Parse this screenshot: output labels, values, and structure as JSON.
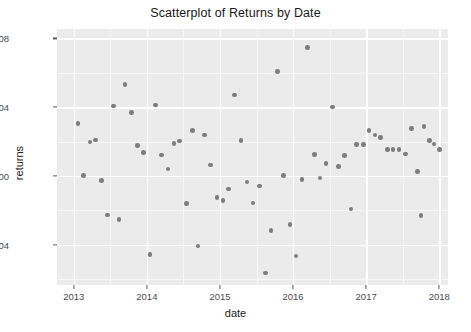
{
  "chart_data": {
    "type": "scatter",
    "title": "Scatterplot of Returns by Date",
    "xlabel": "date",
    "ylabel": "returns",
    "grid": true,
    "legend": null,
    "xlim": [
      2012.77,
      2018.12
    ],
    "ylim": [
      -0.0635,
      0.0855
    ],
    "xticks": [
      2013,
      2014,
      2015,
      2016,
      2017,
      2018
    ],
    "xtick_labels": [
      "2013",
      "2014",
      "2015",
      "2016",
      "2017",
      "2018"
    ],
    "yticks": [
      0.08,
      0.04,
      0.0,
      -0.04
    ],
    "ytick_labels": [
      "0.08",
      "0.04",
      "0.00",
      "-0.04"
    ],
    "point_color": "#7d7d7d",
    "panel_color": "#ebebeb",
    "gridline_color": "#ffffff",
    "series": [
      {
        "name": "returns",
        "points": [
          {
            "x": 2013.06,
            "y": 0.0305
          },
          {
            "x": 2013.13,
            "y": 0.0001
          },
          {
            "x": 2013.22,
            "y": 0.0197
          },
          {
            "x": 2013.3,
            "y": 0.0208
          },
          {
            "x": 2013.38,
            "y": -0.0027
          },
          {
            "x": 2013.46,
            "y": -0.0227
          },
          {
            "x": 2013.54,
            "y": 0.0406
          },
          {
            "x": 2013.62,
            "y": -0.0253
          },
          {
            "x": 2013.7,
            "y": 0.0532
          },
          {
            "x": 2013.79,
            "y": 0.0368
          },
          {
            "x": 2013.87,
            "y": 0.0176
          },
          {
            "x": 2013.95,
            "y": 0.0135
          },
          {
            "x": 2014.04,
            "y": -0.0457
          },
          {
            "x": 2014.12,
            "y": 0.0412
          },
          {
            "x": 2014.2,
            "y": 0.0122
          },
          {
            "x": 2014.29,
            "y": 0.0041
          },
          {
            "x": 2014.37,
            "y": 0.0188
          },
          {
            "x": 2014.45,
            "y": 0.0203
          },
          {
            "x": 2014.54,
            "y": -0.0161
          },
          {
            "x": 2014.62,
            "y": 0.0264
          },
          {
            "x": 2014.7,
            "y": -0.0409
          },
          {
            "x": 2014.79,
            "y": 0.0238
          },
          {
            "x": 2014.87,
            "y": 0.0064
          },
          {
            "x": 2014.96,
            "y": -0.0127
          },
          {
            "x": 2015.04,
            "y": -0.0142
          },
          {
            "x": 2015.12,
            "y": -0.0076
          },
          {
            "x": 2015.2,
            "y": 0.0471
          },
          {
            "x": 2015.29,
            "y": 0.0205
          },
          {
            "x": 2015.37,
            "y": -0.0035
          },
          {
            "x": 2015.45,
            "y": -0.0158
          },
          {
            "x": 2015.54,
            "y": -0.0059
          },
          {
            "x": 2015.62,
            "y": -0.0565
          },
          {
            "x": 2015.7,
            "y": -0.0318
          },
          {
            "x": 2015.79,
            "y": 0.0609
          },
          {
            "x": 2015.87,
            "y": 0.0001
          },
          {
            "x": 2015.96,
            "y": -0.0284
          },
          {
            "x": 2016.04,
            "y": -0.0466
          },
          {
            "x": 2016.12,
            "y": -0.0022
          },
          {
            "x": 2016.2,
            "y": 0.0748
          },
          {
            "x": 2016.29,
            "y": 0.0125
          },
          {
            "x": 2016.37,
            "y": -0.0012
          },
          {
            "x": 2016.45,
            "y": 0.0073
          },
          {
            "x": 2016.54,
            "y": 0.0401
          },
          {
            "x": 2016.62,
            "y": 0.0055
          },
          {
            "x": 2016.7,
            "y": 0.0119
          },
          {
            "x": 2016.79,
            "y": -0.0193
          },
          {
            "x": 2016.87,
            "y": 0.0184
          },
          {
            "x": 2016.96,
            "y": 0.0184
          },
          {
            "x": 2017.04,
            "y": 0.0265
          },
          {
            "x": 2017.12,
            "y": 0.0237
          },
          {
            "x": 2017.2,
            "y": 0.0222
          },
          {
            "x": 2017.29,
            "y": 0.0152
          },
          {
            "x": 2017.37,
            "y": 0.0152
          },
          {
            "x": 2017.45,
            "y": 0.0154
          },
          {
            "x": 2017.54,
            "y": 0.0127
          },
          {
            "x": 2017.62,
            "y": 0.0276
          },
          {
            "x": 2017.7,
            "y": 0.0027
          },
          {
            "x": 2017.75,
            "y": -0.0231
          },
          {
            "x": 2017.79,
            "y": 0.0287
          },
          {
            "x": 2017.87,
            "y": 0.0207
          },
          {
            "x": 2017.93,
            "y": 0.0185
          },
          {
            "x": 2018.0,
            "y": 0.0155
          }
        ]
      }
    ]
  }
}
